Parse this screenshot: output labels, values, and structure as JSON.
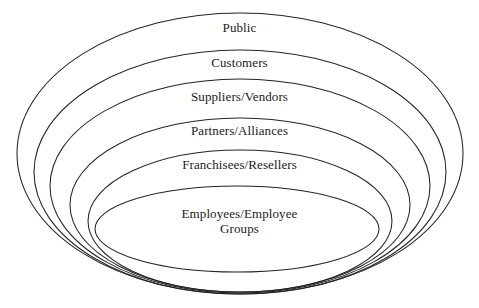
{
  "diagram": {
    "type": "nested-ellipse-stakeholder-map",
    "background_color": "#ffffff",
    "stroke_color": "#232323",
    "text_color": "#1b1b1b",
    "width": 479,
    "height": 308,
    "rings": [
      {
        "index": 0,
        "label": "Public",
        "label_left": 0,
        "label_top": 20,
        "label_width": 479,
        "ellipse": {
          "cx": 240,
          "cy": 153.5,
          "rx": 223,
          "ry": 140.5
        }
      },
      {
        "index": 1,
        "label": "Customers",
        "label_left": 0,
        "label_top": 55,
        "label_width": 479,
        "ellipse": {
          "cx": 240,
          "cy": 172,
          "rx": 206,
          "ry": 122
        }
      },
      {
        "index": 2,
        "label": "Suppliers/Vendors",
        "label_left": 0,
        "label_top": 89,
        "label_width": 479,
        "ellipse": {
          "cx": 240,
          "cy": 186,
          "rx": 190,
          "ry": 107
        }
      },
      {
        "index": 3,
        "label": "Partners/Alliances",
        "label_left": 0,
        "label_top": 123,
        "label_width": 479,
        "ellipse": {
          "cx": 240,
          "cy": 205,
          "rx": 170,
          "ry": 87
        }
      },
      {
        "index": 4,
        "label": "Franchisees/Resellers",
        "label_left": 0,
        "label_top": 157,
        "label_width": 479,
        "ellipse": {
          "cx": 240,
          "cy": 221,
          "rx": 152,
          "ry": 71
        }
      },
      {
        "index": 5,
        "label": "Employees/Employee\nGroups",
        "label_left": 0,
        "label_top": 206,
        "label_width": 479,
        "ellipse": {
          "cx": 237,
          "cy": 229,
          "rx": 142,
          "ry": 43
        }
      }
    ]
  }
}
